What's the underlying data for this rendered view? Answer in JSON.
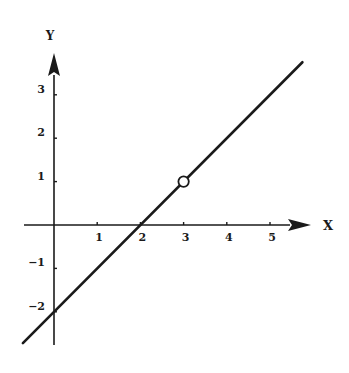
{
  "chart_data": {
    "type": "line",
    "title": "",
    "xlabel": "X",
    "ylabel": "Y",
    "xlim": [
      -0.7,
      5.8
    ],
    "ylim": [
      -2.7,
      3.8
    ],
    "grid": false,
    "legend": null,
    "x_ticks": [
      1,
      2,
      3,
      4,
      5
    ],
    "x_tick_labels": [
      "1",
      "2",
      "3",
      "4",
      "5"
    ],
    "y_ticks": [
      3,
      2,
      1,
      -1,
      -2
    ],
    "y_tick_labels": [
      "3",
      "2",
      "1",
      "-1",
      "-2"
    ],
    "series": [
      {
        "name": "y = x - 2",
        "equation": "y = x - 2",
        "x": [
          -0.72,
          5.75
        ],
        "y": [
          -2.72,
          3.75
        ],
        "color": "#1a1a1a"
      }
    ],
    "annotations": [
      {
        "type": "open-circle",
        "x": 3,
        "y": 1
      }
    ]
  },
  "style": {
    "ink": "#1a1a1a",
    "background": "#ffffff"
  }
}
